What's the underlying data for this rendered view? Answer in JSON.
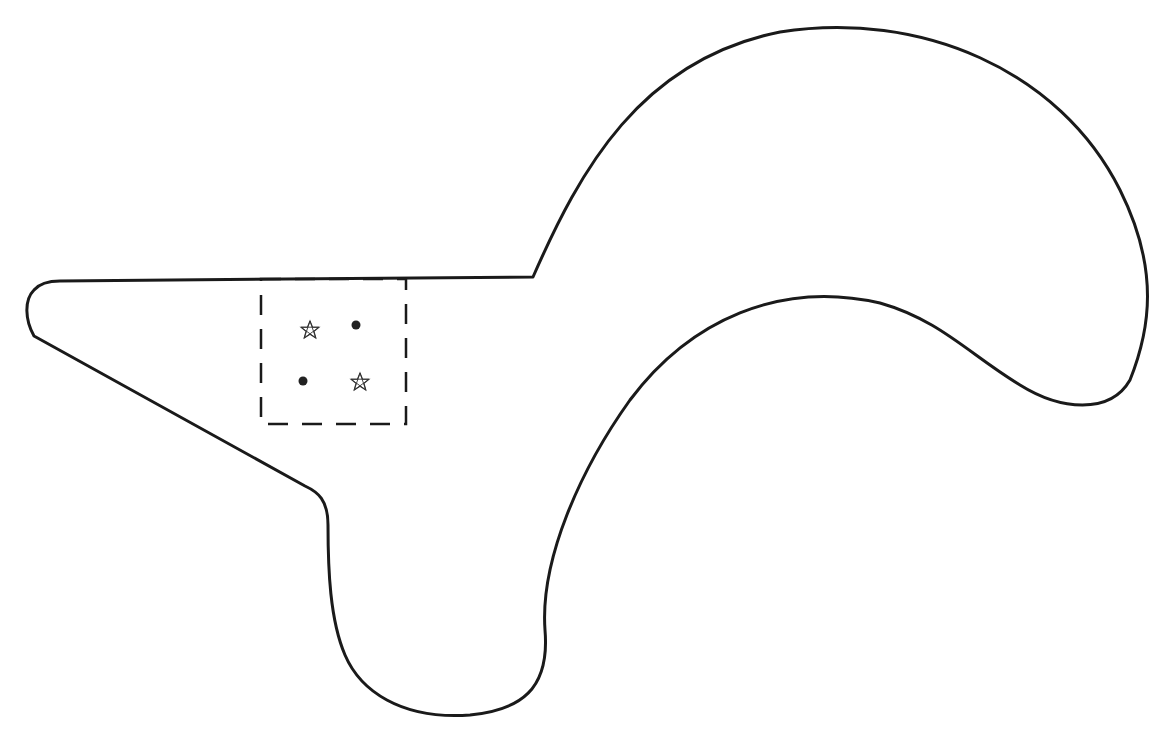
{
  "diagram": {
    "background": "#ffffff",
    "stroke_color": "#1a1a1a",
    "outline_shape": "closed-blob-with-pointed-arm",
    "region_box": {
      "style": "dashed",
      "x": 261,
      "y": 279,
      "width": 145,
      "height": 145
    },
    "markers": [
      {
        "type": "star",
        "x": 310,
        "y": 330
      },
      {
        "type": "dot",
        "x": 356,
        "y": 325
      },
      {
        "type": "dot",
        "x": 303,
        "y": 381
      },
      {
        "type": "star",
        "x": 360,
        "y": 382
      }
    ]
  }
}
